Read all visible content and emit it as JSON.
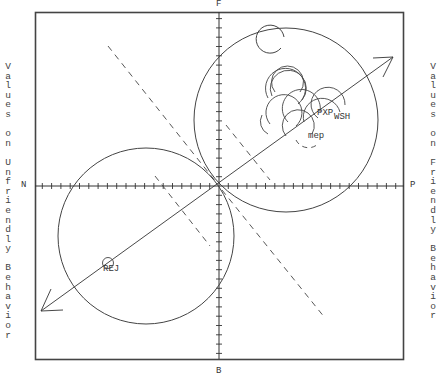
{
  "axes": {
    "top": "F",
    "bottom": "B",
    "left": "N",
    "right": "P"
  },
  "side_labels": {
    "left": "Values on Unfriendly Behavior",
    "right": "Values on Friendly Behavior"
  },
  "point_labels": {
    "rej": "REJ",
    "pxp": "PXP",
    "wsh": "WSH",
    "mep": "mep"
  },
  "colors": {
    "line": "#333333",
    "frame": "#444444",
    "background": "#ffffff"
  }
}
